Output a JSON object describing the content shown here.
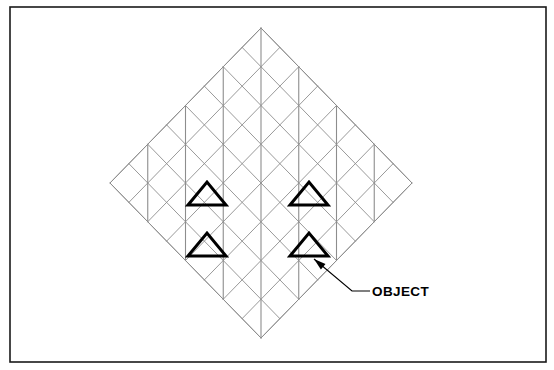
{
  "figure": {
    "title": "",
    "type": "technical-line-drawing",
    "canvas": {
      "width": 554,
      "height": 370,
      "background": "#ffffff"
    },
    "border": {
      "name": "figure-border",
      "x": 10,
      "y": 7,
      "width": 536,
      "height": 355,
      "stroke": "#1a1a1a",
      "stroke_width": 1.6
    },
    "lattice": {
      "description": "45-degree rotated square grid forming a diamond outline",
      "center_x": 261,
      "center_y": 183,
      "half_width": 151,
      "half_height": 155,
      "cells_per_side": 8,
      "stroke": "#8d8d8d",
      "stroke_width": 0.9,
      "top_vertex": [
        261,
        28
      ],
      "right_vertex": [
        412,
        183
      ],
      "bottom_vertex": [
        261,
        338
      ],
      "left_vertex": [
        110,
        183
      ],
      "vertical_lines": {
        "description": "vertical segments drawn at alternate lattice columns",
        "stroke": "#8d8d8d",
        "stroke_width": 1.1
      }
    },
    "objects": {
      "name": "highlighted-objects",
      "count": 4,
      "stroke": "#000000",
      "stroke_width": 3.0,
      "shape": "triangle",
      "triangles": [
        {
          "apex": [
            207,
            182
          ],
          "left": [
            188,
            205
          ],
          "right": [
            226,
            205
          ]
        },
        {
          "apex": [
            309,
            182
          ],
          "left": [
            290,
            205
          ],
          "right": [
            328,
            205
          ]
        },
        {
          "apex": [
            207,
            233
          ],
          "left": [
            188,
            256
          ],
          "right": [
            226,
            256
          ]
        },
        {
          "apex": [
            309,
            233
          ],
          "left": [
            290,
            256
          ],
          "right": [
            328,
            256
          ]
        }
      ]
    },
    "annotation": {
      "name": "object-callout",
      "label": "OBJECT",
      "text_x": 372,
      "text_y": 296,
      "leader": {
        "arrow_tip": [
          314,
          259
        ],
        "bend": [
          352,
          291
        ],
        "end": [
          370,
          291
        ],
        "stroke": "#000000",
        "stroke_width": 1.1
      },
      "arrowhead": {
        "fill": "#000000"
      }
    }
  }
}
